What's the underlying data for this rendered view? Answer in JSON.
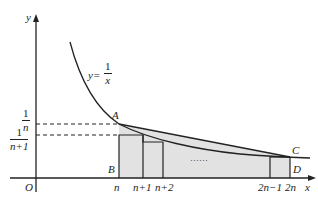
{
  "figure": {
    "axes": {
      "x_label": "x",
      "y_label": "y",
      "origin_label": "O"
    },
    "curve": {
      "label_lhs": "y=",
      "label_num": "1",
      "label_den": "x"
    },
    "y_ticks": [
      {
        "num": "1",
        "den": "n"
      },
      {
        "num": "1",
        "den": "n+1"
      }
    ],
    "x_ticks": [
      "n",
      "n+1",
      "n+2",
      "2n−1",
      "2n"
    ],
    "points": {
      "A": "A",
      "B": "B",
      "C": "C",
      "D": "D"
    },
    "ellipsis": "······",
    "colors": {
      "line": "#222222",
      "fill": "#e2e2e2"
    }
  }
}
